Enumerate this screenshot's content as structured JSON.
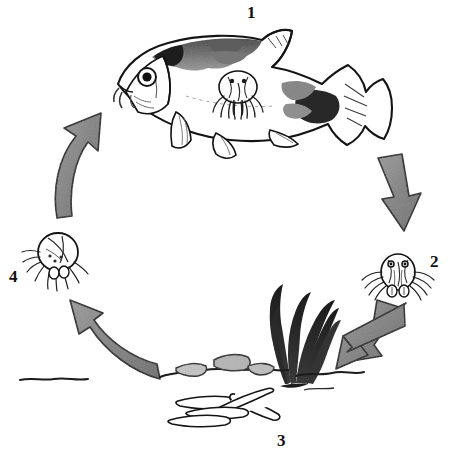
{
  "figure": {
    "background_color": "#ffffff",
    "ink_color": "#111111",
    "arrow_fill_color": "#8a8a8a",
    "arrow_outline_color": "#1a1a1a",
    "width": 451,
    "height": 454,
    "orientation": "clockwise cycle of four numbered stages"
  },
  "labels": {
    "stage1": "1",
    "stage2": "2",
    "stage3": "3",
    "stage4": "4"
  },
  "stages": [
    {
      "number": "1",
      "name": "infected-fish",
      "position": "top",
      "description": "Carp with attached parasite on flank"
    },
    {
      "number": "2",
      "name": "free-swimming-parasite",
      "position": "right",
      "description": "Detached adult parasite swimming free"
    },
    {
      "number": "3",
      "name": "eggs-on-substrate",
      "position": "bottom",
      "description": "Egg strings laid on stones and plants on the bottom"
    },
    {
      "number": "4",
      "name": "hatched-larva",
      "position": "left",
      "description": "Newly hatched larval parasite"
    }
  ],
  "arrows": [
    {
      "name": "arrow-1-to-2",
      "from": "1",
      "to": "2",
      "direction": "down-right"
    },
    {
      "name": "arrow-2-to-3",
      "from": "2",
      "to": "3",
      "direction": "down-left"
    },
    {
      "name": "arrow-3-to-4",
      "from": "3",
      "to": "4",
      "direction": "up-left"
    },
    {
      "name": "arrow-4-to-1",
      "from": "4",
      "to": "1",
      "direction": "up-right"
    }
  ],
  "scene_elements": [
    {
      "name": "fish",
      "label": "carp"
    },
    {
      "name": "attached-parasite",
      "label": "parasite on fish"
    },
    {
      "name": "aquatic-plant",
      "label": "water weed"
    },
    {
      "name": "substrate-rocks",
      "label": "stones and gravel"
    },
    {
      "name": "egg-strings",
      "label": "egg strings"
    }
  ]
}
